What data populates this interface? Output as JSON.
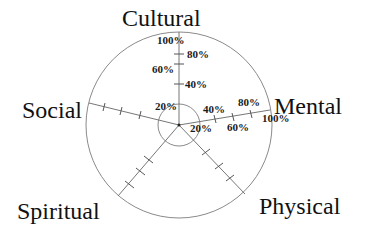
{
  "diagram": {
    "type": "radar-axes",
    "center": [
      179,
      125
    ],
    "outer_radius": 93,
    "inner_radius": 21,
    "colors": {
      "lines": "#8a8a8a",
      "text": "#111111"
    },
    "axes": [
      {
        "name": "Cultural",
        "label": "Cultural"
      },
      {
        "name": "Mental",
        "label": "Mental"
      },
      {
        "name": "Physical",
        "label": "Physical"
      },
      {
        "name": "Spiritual",
        "label": "Spiritual"
      },
      {
        "name": "Social",
        "label": "Social"
      }
    ],
    "cultural_ticks": {
      "t20": "20%",
      "t40": "40%",
      "t60": "60%",
      "t80": "80%",
      "t100": "100%"
    },
    "mental_ticks": {
      "t20": "20%",
      "t40": "40%",
      "t60": "60%",
      "t80": "80%",
      "t100": "100%"
    }
  }
}
